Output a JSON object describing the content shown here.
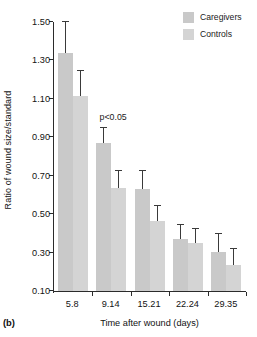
{
  "panel": {
    "label": "(b)"
  },
  "legend": {
    "position": "top-right",
    "entries": [
      {
        "name": "Caregivers",
        "color": "#c9c9c9"
      },
      {
        "name": "Controls",
        "color": "#d4d4d4"
      }
    ]
  },
  "annotation": {
    "text": "p<0.05"
  },
  "chart_data": {
    "type": "bar",
    "title": "",
    "subtitle": "",
    "xlabel": "Time after wound (days)",
    "ylabel": "Ratio of wound size/standard",
    "categories": [
      "5.8",
      "9.14",
      "15.21",
      "22.24",
      "29.35"
    ],
    "yticks": [
      "0.10",
      "0.30",
      "0.50",
      "0.70",
      "0.90",
      "1.10",
      "1.30",
      "1.50"
    ],
    "ytick_values": [
      0.1,
      0.3,
      0.5,
      0.7,
      0.9,
      1.1,
      1.3,
      1.5
    ],
    "ylim": [
      0.1,
      1.5
    ],
    "grid": false,
    "legend_position": "top-right",
    "series": [
      {
        "name": "Caregivers",
        "color": "#c9c9c9",
        "values": [
          1.34,
          0.87,
          0.63,
          0.37,
          0.305
        ],
        "error_upper": [
          1.5,
          0.95,
          0.725,
          0.445,
          0.395
        ]
      },
      {
        "name": "Controls",
        "color": "#d4d4d4",
        "values": [
          1.115,
          0.635,
          0.465,
          0.35,
          0.235
        ],
        "error_upper": [
          1.245,
          0.725,
          0.545,
          0.425,
          0.32
        ]
      }
    ],
    "annotations": [
      {
        "text": "p<0.05",
        "category": "9.14",
        "value": 0.98
      }
    ]
  }
}
